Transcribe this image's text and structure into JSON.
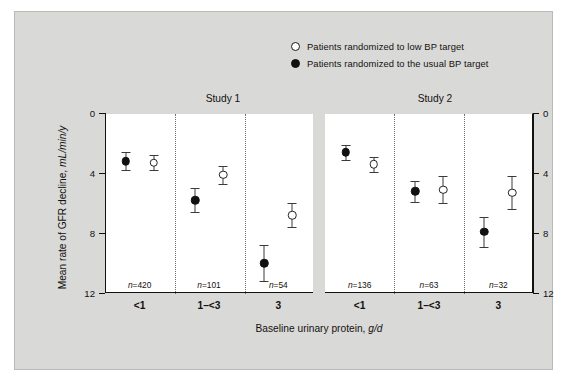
{
  "legend": {
    "items": [
      {
        "marker": "open-circle",
        "label": "Patients randomized to low BP target"
      },
      {
        "marker": "filled-circle",
        "label": "Patients randomized to the usual BP target"
      }
    ]
  },
  "chart_data": {
    "type": "scatter",
    "title": "",
    "xlabel": "Baseline urinary protein, g/d",
    "ylabel": "Mean rate of GFR decline, mL/min/y",
    "ylim": [
      0,
      12
    ],
    "y_inverted": true,
    "yticks": [
      0,
      4,
      8,
      12
    ],
    "ytick_labels": [
      "0",
      "4",
      "8",
      "12"
    ],
    "grid": false,
    "legend_position": "top-right",
    "panels": [
      {
        "name": "Study 1",
        "categories": [
          "<1",
          "1–<3",
          "3"
        ],
        "n_labels": [
          "n=420",
          "n=101",
          "n=54"
        ],
        "n_values": [
          420,
          101,
          54
        ],
        "series": [
          {
            "name": "Patients randomized to the usual BP target",
            "marker": "filled-circle",
            "values": [
              3.2,
              5.8,
              10.0
            ],
            "err_low": [
              2.6,
              5.0,
              8.8
            ],
            "err_high": [
              3.8,
              6.6,
              11.2
            ]
          },
          {
            "name": "Patients randomized to low BP target",
            "marker": "open-circle",
            "values": [
              3.3,
              4.1,
              6.8
            ],
            "err_low": [
              2.8,
              3.5,
              6.0
            ],
            "err_high": [
              3.8,
              4.7,
              7.6
            ]
          }
        ]
      },
      {
        "name": "Study 2",
        "categories": [
          "<1",
          "1–<3",
          "3"
        ],
        "n_labels": [
          "n=136",
          "n=63",
          "n=32"
        ],
        "n_values": [
          136,
          63,
          32
        ],
        "series": [
          {
            "name": "Patients randomized to the usual BP target",
            "marker": "filled-circle",
            "values": [
              2.6,
              5.2,
              7.9
            ],
            "err_low": [
              2.1,
              4.5,
              6.9
            ],
            "err_high": [
              3.1,
              5.9,
              8.9
            ]
          },
          {
            "name": "Patients randomized to low BP target",
            "marker": "open-circle",
            "values": [
              3.4,
              5.1,
              5.3
            ],
            "err_low": [
              2.9,
              4.2,
              4.2
            ],
            "err_high": [
              3.9,
              6.0,
              6.4
            ]
          }
        ]
      }
    ]
  }
}
